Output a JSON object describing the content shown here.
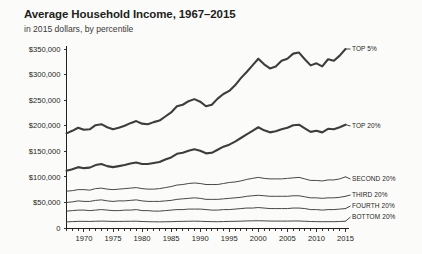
{
  "header": {
    "title": "Average Household Income, 1967–2015",
    "subtitle": "in 2015 dollars, by percentile"
  },
  "chart_data": {
    "type": "line",
    "title": "Average Household Income, 1967–2015",
    "subtitle": "in 2015 dollars, by percentile",
    "xlabel": "",
    "ylabel": "",
    "xlim": [
      1967,
      2015
    ],
    "ylim": [
      0,
      350000
    ],
    "grid": false,
    "legend_position": "right-inline-labels",
    "y_ticks": [
      0,
      50000,
      100000,
      150000,
      200000,
      250000,
      300000,
      350000
    ],
    "y_tick_labels": [
      "0",
      "$50,000",
      "$100,000",
      "$150,000",
      "$200,000",
      "$250,000",
      "$300,000",
      "$350,000"
    ],
    "x_ticks_labeled": [
      1970,
      1975,
      1980,
      1985,
      1990,
      1995,
      2000,
      2005,
      2010,
      2015
    ],
    "x_tick_labels": [
      "1970",
      "1975",
      "1980",
      "1985",
      "1990",
      "1995",
      "2000",
      "2005",
      "2010",
      "2015"
    ],
    "x_tick_interval_minor": 1,
    "x": [
      1967,
      1968,
      1969,
      1970,
      1971,
      1972,
      1973,
      1974,
      1975,
      1976,
      1977,
      1978,
      1979,
      1980,
      1981,
      1982,
      1983,
      1984,
      1985,
      1986,
      1987,
      1988,
      1989,
      1990,
      1991,
      1992,
      1993,
      1994,
      1995,
      1996,
      1997,
      1998,
      1999,
      2000,
      2001,
      2002,
      2003,
      2004,
      2005,
      2006,
      2007,
      2008,
      2009,
      2010,
      2011,
      2012,
      2013,
      2014,
      2015
    ],
    "series": [
      {
        "name": "TOP 5%",
        "label": "TOP 5%",
        "weight": "heavy",
        "color": "#3d3d3c",
        "values": [
          185000,
          190000,
          196000,
          192000,
          193000,
          201000,
          203000,
          197000,
          193000,
          196000,
          200000,
          205000,
          209000,
          204000,
          203000,
          207000,
          210000,
          218000,
          226000,
          238000,
          241000,
          248000,
          252000,
          247000,
          238000,
          241000,
          253000,
          262000,
          268000,
          279000,
          293000,
          305000,
          318000,
          331000,
          320000,
          312000,
          316000,
          327000,
          331000,
          341000,
          343000,
          330000,
          318000,
          322000,
          316000,
          330000,
          327000,
          337000,
          350000
        ]
      },
      {
        "name": "TOP 20%",
        "label": "TOP 20%",
        "weight": "heavy",
        "color": "#3d3d3c",
        "values": [
          112000,
          115000,
          119000,
          117000,
          118000,
          123000,
          125000,
          121000,
          119000,
          121000,
          123000,
          126000,
          128000,
          125000,
          125000,
          127000,
          129000,
          134000,
          138000,
          145000,
          147000,
          151000,
          154000,
          151000,
          146000,
          147000,
          153000,
          159000,
          163000,
          169000,
          176000,
          183000,
          190000,
          197000,
          191000,
          187000,
          189000,
          193000,
          196000,
          201000,
          202000,
          195000,
          188000,
          190000,
          187000,
          194000,
          193000,
          197000,
          202000
        ]
      },
      {
        "name": "SECOND 20%",
        "label": "SECOND 20%",
        "weight": "light",
        "color": "#4a4a48",
        "values": [
          72000,
          73000,
          75000,
          75000,
          74000,
          77000,
          78000,
          76000,
          75000,
          76000,
          77000,
          78000,
          79000,
          77000,
          76000,
          76000,
          77000,
          79000,
          81000,
          84000,
          85000,
          87000,
          88000,
          87000,
          85000,
          85000,
          85000,
          87000,
          89000,
          90000,
          92000,
          95000,
          97000,
          99000,
          97000,
          96000,
          96000,
          96000,
          97000,
          98000,
          99000,
          96000,
          93000,
          93000,
          92000,
          94000,
          94000,
          96000,
          100000
        ]
      },
      {
        "name": "THIRD 20%",
        "label": "THIRD 20%",
        "weight": "light",
        "color": "#4a4a48",
        "values": [
          50000,
          51000,
          53000,
          52000,
          52000,
          54000,
          55000,
          53000,
          52000,
          53000,
          53000,
          54000,
          55000,
          53000,
          52000,
          52000,
          52000,
          53000,
          54000,
          56000,
          57000,
          58000,
          59000,
          58000,
          56000,
          56000,
          56000,
          57000,
          58000,
          59000,
          60000,
          62000,
          63000,
          64000,
          63000,
          62000,
          62000,
          62000,
          62000,
          63000,
          63000,
          61000,
          59000,
          59000,
          58000,
          59000,
          59000,
          60000,
          62000
        ]
      },
      {
        "name": "FOURTH 20%",
        "label": "FOURTH 20%",
        "weight": "light",
        "color": "#4a4a48",
        "values": [
          33000,
          34000,
          35000,
          35000,
          34000,
          35000,
          36000,
          35000,
          34000,
          34000,
          35000,
          35000,
          36000,
          34000,
          34000,
          33000,
          33000,
          34000,
          35000,
          36000,
          36000,
          37000,
          37000,
          37000,
          36000,
          35000,
          35000,
          36000,
          36000,
          37000,
          38000,
          39000,
          39000,
          40000,
          39000,
          38000,
          38000,
          38000,
          38000,
          39000,
          39000,
          38000,
          36000,
          36000,
          35000,
          36000,
          36000,
          37000,
          38000
        ]
      },
      {
        "name": "BOTTOM 20%",
        "label": "BOTTOM 20%",
        "weight": "light",
        "color": "#4a4a48",
        "values": [
          12000,
          12500,
          13000,
          13000,
          12800,
          13200,
          13500,
          13200,
          12800,
          12900,
          13000,
          13200,
          13300,
          12700,
          12400,
          12100,
          12000,
          12200,
          12400,
          12800,
          13000,
          13200,
          13400,
          13200,
          12700,
          12500,
          12300,
          12600,
          12900,
          13100,
          13400,
          13800,
          14000,
          14200,
          13900,
          13600,
          13500,
          13500,
          13500,
          13700,
          13700,
          13200,
          12700,
          12500,
          12300,
          12400,
          12400,
          12700,
          13300
        ]
      }
    ],
    "label_anchors": [
      {
        "name": "TOP 5%",
        "x": 352,
        "y": 51
      },
      {
        "name": "TOP 20%",
        "x": 352,
        "y": 128
      },
      {
        "name": "SECOND 20%",
        "x": 352,
        "y": 181
      },
      {
        "name": "THIRD 20%",
        "x": 352,
        "y": 197
      },
      {
        "name": "FOURTH 20%",
        "x": 352,
        "y": 208
      },
      {
        "name": "BOTTOM 20%",
        "x": 352,
        "y": 219
      }
    ]
  }
}
